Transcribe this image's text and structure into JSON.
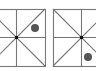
{
  "figure": {
    "panels": [
      {
        "name": "left-panel",
        "box": [
          -12,
          9,
          57,
          57
        ],
        "marker": {
          "cx": 35,
          "cy": 28,
          "r": 4
        }
      },
      {
        "name": "right-panel",
        "box": [
          53,
          9,
          57,
          57
        ],
        "marker": {
          "cx": 88,
          "cy": 57,
          "r": 4
        }
      }
    ],
    "colors": {
      "line": "#777777",
      "dot": "#555555",
      "center": "#111111"
    }
  }
}
